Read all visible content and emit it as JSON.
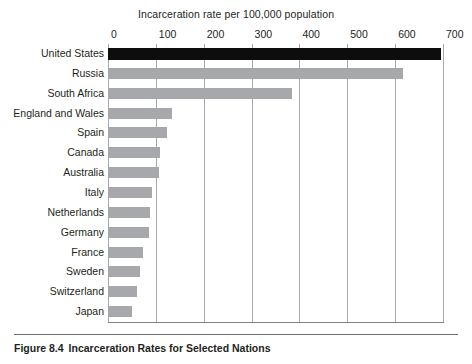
{
  "figure": {
    "caption_number": "Figure 8.4",
    "caption_text": "Incarceration Rates for Selected Nations"
  },
  "chart_data": {
    "type": "bar",
    "orientation": "horizontal",
    "title": "Incarceration rate per 100,000 population",
    "xlabel": "Incarceration rate per 100,000 population",
    "ylabel": "",
    "xlim": [
      0,
      700
    ],
    "xticks": [
      0,
      100,
      200,
      300,
      400,
      500,
      600,
      700
    ],
    "xtick_labels": [
      "0",
      "100",
      "200",
      "300",
      "400",
      "500",
      "600",
      "700"
    ],
    "grid": true,
    "legend": "none",
    "bar_color": "#a6a8ab",
    "highlight_color": "#0d0d0d",
    "highlight_category": "United States",
    "categories": [
      "United States",
      "Russia",
      "South Africa",
      "England and Wales",
      "Spain",
      "Canada",
      "Australia",
      "Italy",
      "Netherlands",
      "Germany",
      "France",
      "Sweden",
      "Switzerland",
      "Japan"
    ],
    "values": [
      695,
      616,
      384,
      134,
      123,
      109,
      107,
      92,
      88,
      85,
      74,
      66,
      61,
      50
    ]
  }
}
